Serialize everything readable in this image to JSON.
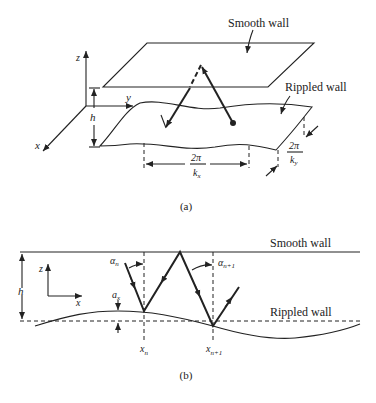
{
  "figure_a": {
    "caption": "(a)",
    "labels": {
      "smooth_wall": "Smooth wall",
      "rippled_wall": "Rippled wall",
      "axis_z": "z",
      "axis_y": "y",
      "axis_x": "x",
      "height": "h",
      "wavelength_x_num": "2π",
      "wavelength_x_den": "k",
      "wavelength_x_sub": "x",
      "wavelength_y_num": "2π",
      "wavelength_y_den": "k",
      "wavelength_y_sub": "y"
    }
  },
  "figure_b": {
    "caption": "(b)",
    "labels": {
      "smooth_wall": "Smooth wall",
      "rippled_wall": "Rippled wall",
      "axis_z": "z",
      "axis_x": "x",
      "height": "h",
      "amplitude": "a",
      "amplitude_sub": "x",
      "alpha_n": "α",
      "alpha_n_sub": "n",
      "alpha_n1": "α",
      "alpha_n1_sub": "n+1",
      "x_n": "x",
      "x_n_sub": "n",
      "x_n1": "x",
      "x_n1_sub": "n+1"
    }
  }
}
